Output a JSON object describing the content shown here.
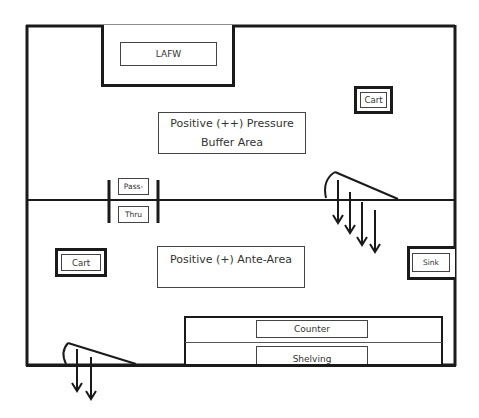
{
  "diagram": {
    "rooms": [
      {
        "id": "buffer",
        "label_line1": "Positive (++) Pressure",
        "label_line2": "Buffer Area"
      },
      {
        "id": "ante",
        "label": "Positive (+) Ante-Area"
      }
    ],
    "equipment": {
      "lafw": "LAFW",
      "cart_buffer": "Cart",
      "cart_ante": "Cart",
      "sink": "Sink",
      "pass_thru_top": "Pass-",
      "pass_thru_bottom": "Thru",
      "counter": "Counter",
      "shelving": "Shelving"
    },
    "doors": [
      {
        "id": "buffer-door",
        "arrows": 4
      },
      {
        "id": "entry-door",
        "arrows": 2
      }
    ],
    "colors": {
      "line": "#1a1a1a",
      "text": "#333333",
      "background": "#ffffff"
    }
  }
}
